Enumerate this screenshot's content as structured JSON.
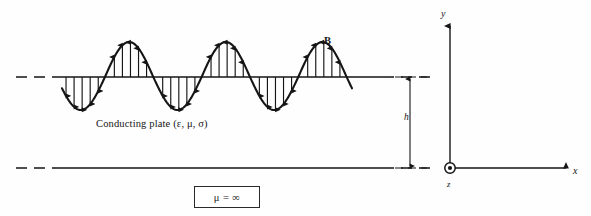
{
  "figure": {
    "background_color": "#fefefe",
    "ink_color": "#151515"
  },
  "labels": {
    "conducting_plate": "Conducting plate (ε, μ, σ)",
    "b_field": "B",
    "height_dimension": "h",
    "mu_infinity": "μ = ∞",
    "axis_y": "y",
    "axis_x": "x",
    "axis_z": "z"
  },
  "icons": {
    "z_axis_out_of_page": "circled-dot-icon",
    "y_axis_arrow": "arrow-up-icon",
    "x_axis_arrow": "arrow-right-icon",
    "dimension_arrow_top": "arrow-up-icon",
    "dimension_arrow_bottom": "arrow-down-icon"
  },
  "chart_data": {
    "type": "line",
    "xlabel": "x",
    "ylabel": "y",
    "series": [
      {
        "name": "B",
        "description": "Sinusoidal magnetic flux density distribution along the conducting plate surface",
        "waveform": "sine",
        "cycles": 3,
        "x_start_px": 62,
        "x_end_px": 352,
        "baseline_y_px": 77,
        "amplitude_up_px": 35,
        "amplitude_down_px": 33,
        "phase_offset_deg": 200,
        "flux_arrow_count": 36,
        "arrow_direction_positive": "up",
        "arrow_direction_negative": "down"
      }
    ],
    "reference_lines": [
      {
        "name": "plate-top-surface",
        "y_px": 77,
        "x_start_px": 16,
        "x_end_px": 575,
        "dash_segment_end_px": 62,
        "style": "dashed-then-solid"
      },
      {
        "name": "plate-bottom-surface",
        "y_px": 168,
        "x_start_px": 16,
        "x_end_px": 575,
        "dash_segment_end_px": 62,
        "style": "dashed-then-solid"
      }
    ],
    "dimension": {
      "name": "h",
      "from_y_px": 77,
      "to_y_px": 168,
      "x_px": 410,
      "value_label": "h"
    },
    "axes": {
      "origin_px": [
        450,
        168
      ],
      "y_axis_top_px": 22,
      "x_axis_right_px": 568,
      "z_axis_marker": "out-of-page"
    },
    "grid": false,
    "legend": false
  }
}
